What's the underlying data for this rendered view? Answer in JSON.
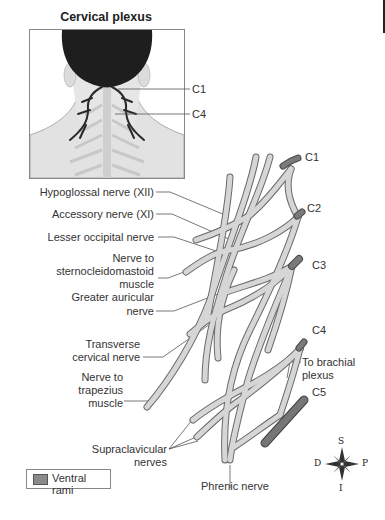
{
  "figure": {
    "title": "Cervical plexus",
    "inset": {
      "labels": [
        "C1",
        "C4"
      ]
    },
    "root_labels": [
      "C1",
      "C2",
      "C3",
      "C4",
      "C5"
    ],
    "nerve_labels": {
      "hypoglossal": "Hypoglossal nerve (XII)",
      "accessory": "Accessory nerve (XI)",
      "lesser_occipital": "Lesser occipital nerve",
      "scm_line1": "Nerve to",
      "scm_line2": "sternocleidomastoid",
      "scm_line3": "muscle",
      "greater_auricular_line1": "Greater auricular",
      "greater_auricular_line2": "nerve",
      "transverse_line1": "Transverse",
      "transverse_line2": "cervical nerve",
      "trapezius_line1": "Nerve to",
      "trapezius_line2": "trapezius",
      "trapezius_line3": "muscle",
      "supraclavicular_line1": "Supraclavicular",
      "supraclavicular_line2": "nerves",
      "phrenic": "Phrenic nerve",
      "brachial_line1": "To brachial",
      "brachial_line2": "plexus"
    },
    "legend": {
      "label": "Ventral rami",
      "swatch_color": "#8a8a8a"
    },
    "compass": {
      "top": "S",
      "bottom": "I",
      "left": "D",
      "right": "P"
    },
    "colors": {
      "nerve_fill": "#d4d4d4",
      "nerve_outline": "#6a6a6a",
      "ventral_rami": "#7a7a7a",
      "hair": "#1e1e1e",
      "skin": "#e6e6e6"
    }
  }
}
